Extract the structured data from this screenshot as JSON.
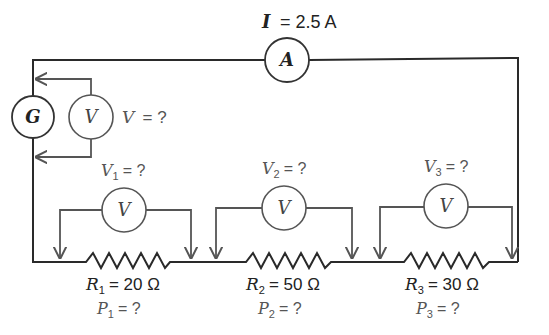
{
  "circuit": {
    "current_label": {
      "symbol": "I",
      "value": "= 2.5 A"
    },
    "ammeter": {
      "symbol": "A"
    },
    "generator": {
      "symbol": "G"
    },
    "source_voltmeter": {
      "symbol": "V",
      "label_symbol": "V",
      "label_value": "= ?"
    },
    "resistors": [
      {
        "id": "R1",
        "r_symbol": "R",
        "r_sub": "1",
        "r_value": "= 20 Ω",
        "p_symbol": "P",
        "p_sub": "1",
        "p_value": "= ?",
        "voltmeter_symbol": "V",
        "v_symbol": "V",
        "v_sub": "1",
        "v_value": "= ?"
      },
      {
        "id": "R2",
        "r_symbol": "R",
        "r_sub": "2",
        "r_value": "= 50 Ω",
        "p_symbol": "P",
        "p_sub": "2",
        "p_value": "= ?",
        "voltmeter_symbol": "V",
        "v_symbol": "V",
        "v_sub": "2",
        "v_value": "= ?"
      },
      {
        "id": "R3",
        "r_symbol": "R",
        "r_sub": "3",
        "r_value": "= 30 Ω",
        "p_symbol": "P",
        "p_sub": "3",
        "p_value": "= ?",
        "voltmeter_symbol": "V",
        "v_symbol": "V",
        "v_sub": "3",
        "v_value": "= ?"
      }
    ]
  },
  "colors": {
    "wire": "#2a2a2a",
    "probe": "#555555",
    "text": "#222222",
    "text_gray": "#555555",
    "background": "#ffffff"
  }
}
